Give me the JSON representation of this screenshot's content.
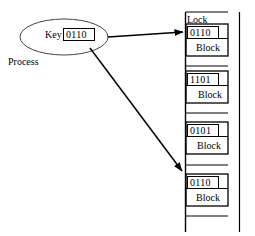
{
  "diagram": {
    "title_texts": {
      "lock_column_label": "Lock",
      "process_label": "Process",
      "key_label": "Key"
    },
    "process": {
      "name": "Process",
      "key_label": "Key",
      "key_value": "0110",
      "ellipse": {
        "cx": 64,
        "cy": 37,
        "rx": 44,
        "ry": 18
      }
    },
    "lock_column": {
      "label": "Lock",
      "left_rail_x": 185,
      "right_rail_x": 240,
      "top_y": 12,
      "bottom_y": 232
    },
    "blocks": [
      {
        "key_value": "0110",
        "body_label": "Block",
        "top": 24,
        "height": 32,
        "key_box": {
          "x": 187,
          "y": 26,
          "w": 32,
          "h": 12
        },
        "targeted": true
      },
      {
        "key_value": "1101",
        "body_label": "Block",
        "top": 71,
        "height": 32,
        "key_box": {
          "x": 187,
          "y": 73,
          "w": 32,
          "h": 12
        },
        "targeted": false
      },
      {
        "key_value": "0101",
        "body_label": "Block",
        "top": 122,
        "height": 32,
        "key_box": {
          "x": 187,
          "y": 124,
          "w": 32,
          "h": 12
        },
        "targeted": false
      },
      {
        "key_value": "0110",
        "body_label": "Block",
        "top": 174,
        "height": 32,
        "key_box": {
          "x": 187,
          "y": 176,
          "w": 32,
          "h": 12
        },
        "targeted": true
      }
    ],
    "arrows": [
      {
        "name": "process-to-first-block",
        "x1": 108,
        "y1": 38,
        "x2": 184,
        "y2": 32
      },
      {
        "name": "process-to-fourth-block",
        "x1": 90,
        "y1": 48,
        "x2": 184,
        "y2": 172
      }
    ],
    "colors": {
      "stroke": "#000000",
      "background": "#ffffff",
      "text": "#000000"
    }
  }
}
